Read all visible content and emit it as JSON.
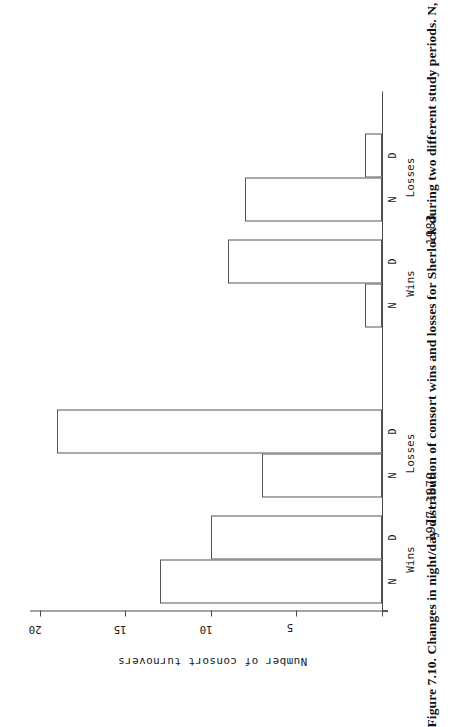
{
  "figure": {
    "caption": "Figure 7.10. Changes in night/day distribution of consort wins and losses for Sherlock during two different study periods. N, night; D, day."
  },
  "chart_data": {
    "type": "bar",
    "title": "",
    "xlabel": "",
    "ylabel": "Number of consort turnovers",
    "ylim": [
      0,
      22
    ],
    "yticks": [
      5,
      10,
      15,
      20
    ],
    "ytick_labels": [
      "5",
      "10",
      "15",
      "20"
    ],
    "grid": false,
    "legend": null,
    "orientation": "vertical",
    "categories": [
      "N",
      "D",
      "N",
      "D",
      "N",
      "D",
      "N",
      "D"
    ],
    "values": [
      13,
      10,
      7,
      19,
      1,
      9,
      8,
      1
    ],
    "groups": [
      {
        "label": "Wins",
        "period": "1977-1979",
        "bars": [
          {
            "category": "N",
            "value": 13
          },
          {
            "category": "D",
            "value": 10
          }
        ]
      },
      {
        "label": "Losses",
        "period": "1977-1979",
        "bars": [
          {
            "category": "N",
            "value": 7
          },
          {
            "category": "D",
            "value": 19
          }
        ]
      },
      {
        "label": "Wins",
        "period": "1983",
        "bars": [
          {
            "category": "N",
            "value": 1
          },
          {
            "category": "D",
            "value": 9
          }
        ]
      },
      {
        "label": "Losses",
        "period": "1983",
        "bars": [
          {
            "category": "N",
            "value": 8
          },
          {
            "category": "D",
            "value": 1
          }
        ]
      }
    ],
    "periods": [
      {
        "label": "1977-1979"
      },
      {
        "label": "1983"
      }
    ],
    "colors": {
      "bar_fill": "#ffffff",
      "bar_stroke": "#555555",
      "axis": "#4a4a4a",
      "text": "#1c1c1c"
    }
  },
  "axis": {
    "tick_20": "20",
    "tick_15": "15",
    "tick_10": "10",
    "tick_5": "5",
    "y_title": "Number of consort turnovers"
  },
  "labels": {
    "wins_1": "Wins",
    "losses_1": "Losses",
    "wins_2": "Wins",
    "losses_2": "Losses",
    "period_1": "1977-1979",
    "period_2": "1983",
    "cat_n_1": "N",
    "cat_d_1": "D",
    "cat_n_2": "N",
    "cat_d_2": "D",
    "cat_n_3": "N",
    "cat_d_3": "D",
    "cat_n_4": "N",
    "cat_d_4": "D"
  }
}
